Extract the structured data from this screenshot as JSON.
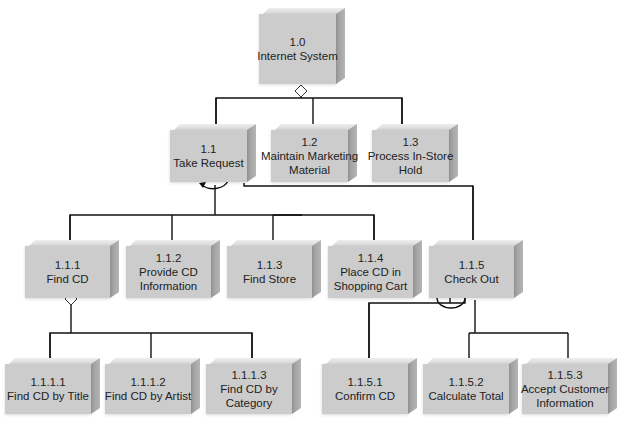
{
  "diagram": {
    "type": "hierarchy",
    "nodes": {
      "n1_0": {
        "id": "1.0",
        "line1": "Internet System",
        "line2": ""
      },
      "n1_1": {
        "id": "1.1",
        "line1": "Take Request",
        "line2": ""
      },
      "n1_2": {
        "id": "1.2",
        "line1": "Maintain Marketing",
        "line2": "Material"
      },
      "n1_3": {
        "id": "1.3",
        "line1": "Process In-Store",
        "line2": "Hold"
      },
      "n1_1_1": {
        "id": "1.1.1",
        "line1": "Find CD",
        "line2": ""
      },
      "n1_1_2": {
        "id": "1.1.2",
        "line1": "Provide CD",
        "line2": "Information"
      },
      "n1_1_3": {
        "id": "1.1.3",
        "line1": "Find Store",
        "line2": ""
      },
      "n1_1_4": {
        "id": "1.1.4",
        "line1": "Place CD in",
        "line2": "Shopping Cart"
      },
      "n1_1_5": {
        "id": "1.1.5",
        "line1": "Check Out",
        "line2": ""
      },
      "n1_1_1_1": {
        "id": "1.1.1.1",
        "line1": "Find CD by Title",
        "line2": ""
      },
      "n1_1_1_2": {
        "id": "1.1.1.2",
        "line1": "Find CD by Artist",
        "line2": ""
      },
      "n1_1_1_3": {
        "id": "1.1.1.3",
        "line1": "Find CD by",
        "line2": "Category"
      },
      "n1_1_5_1": {
        "id": "1.1.5.1",
        "line1": "Confirm CD",
        "line2": ""
      },
      "n1_1_5_2": {
        "id": "1.1.5.2",
        "line1": "Calculate Total",
        "line2": ""
      },
      "n1_1_5_3": {
        "id": "1.1.5.3",
        "line1": "Accept Customer",
        "line2": "Information"
      }
    },
    "edges": [
      {
        "from": "1.0",
        "to": "1.1",
        "connector": "selection-diamond"
      },
      {
        "from": "1.0",
        "to": "1.2",
        "connector": "selection-diamond"
      },
      {
        "from": "1.0",
        "to": "1.3",
        "connector": "selection-diamond"
      },
      {
        "from": "1.1",
        "to": "1.1.1",
        "connector": "iteration-loop"
      },
      {
        "from": "1.1",
        "to": "1.1.2",
        "connector": "iteration-loop"
      },
      {
        "from": "1.1",
        "to": "1.1.3",
        "connector": "iteration-loop"
      },
      {
        "from": "1.1",
        "to": "1.1.4",
        "connector": "iteration-loop"
      },
      {
        "from": "1.1",
        "to": "1.1.5",
        "connector": "sequence"
      },
      {
        "from": "1.1.1",
        "to": "1.1.1.1",
        "connector": "selection-diamond"
      },
      {
        "from": "1.1.1",
        "to": "1.1.1.2",
        "connector": "selection-diamond"
      },
      {
        "from": "1.1.1",
        "to": "1.1.1.3",
        "connector": "selection-diamond"
      },
      {
        "from": "1.1.5",
        "to": "1.1.5.1",
        "connector": "iteration-loop"
      },
      {
        "from": "1.1.5",
        "to": "1.1.5.2",
        "connector": "sequence"
      },
      {
        "from": "1.1.5",
        "to": "1.1.5.3",
        "connector": "sequence"
      }
    ],
    "colors": {
      "box_front": "#cccccc",
      "box_side": "#a8a8a8",
      "box_top": "#e4e4e4",
      "line": "#111111"
    }
  }
}
